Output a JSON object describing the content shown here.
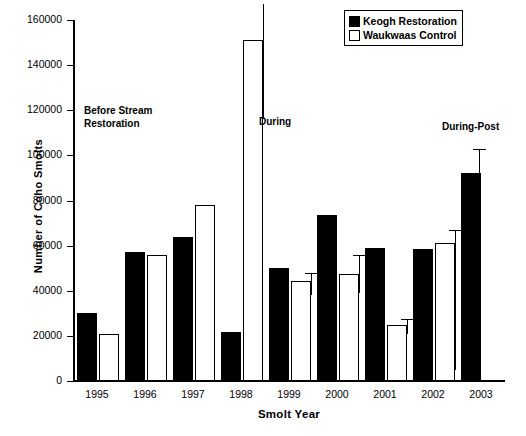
{
  "chart_data": {
    "type": "bar",
    "title": "",
    "xlabel": "Smolt Year",
    "ylabel": "Number  of  Coho  Smolts",
    "categories": [
      "1995",
      "1996",
      "1997",
      "1998",
      "1999",
      "2000",
      "2001",
      "2002",
      "2003"
    ],
    "ylim": [
      0,
      160000
    ],
    "ytick_values": [
      0,
      20000,
      40000,
      60000,
      80000,
      100000,
      120000,
      140000,
      160000
    ],
    "ytick_labels": [
      "0",
      "20000",
      "40000",
      "60000",
      "80000",
      "100000",
      "120000",
      "140000",
      "160000"
    ],
    "grid": false,
    "legend_position": "top-right",
    "series": [
      {
        "name": "Keogh  Restoration",
        "color": "#000000",
        "fill": "solid",
        "values": [
          30000,
          57000,
          64000,
          21500,
          50000,
          73500,
          59000,
          58500,
          92000
        ],
        "errors_low": [
          null,
          null,
          null,
          null,
          null,
          null,
          null,
          null,
          80000
        ],
        "errors_high": [
          null,
          null,
          null,
          null,
          null,
          null,
          null,
          null,
          103000
        ]
      },
      {
        "name": "Waukwaas Control",
        "color": "#ffffff",
        "fill": "hollow",
        "values": [
          21000,
          56000,
          78000,
          151000,
          44500,
          47500,
          25000,
          61000,
          null
        ],
        "errors_low": [
          null,
          null,
          null,
          116000,
          38000,
          39000,
          21000,
          5000,
          null
        ],
        "errors_high": [
          null,
          null,
          null,
          167000,
          48000,
          56000,
          27500,
          67000,
          null
        ]
      }
    ],
    "annotations": [
      {
        "text": "Before Stream\nRestoration",
        "x_px": 84,
        "y_px": 104
      },
      {
        "text": "During",
        "x_px": 259,
        "y_px": 115
      },
      {
        "text": "During-Post",
        "x_px": 442,
        "y_px": 120
      }
    ]
  }
}
